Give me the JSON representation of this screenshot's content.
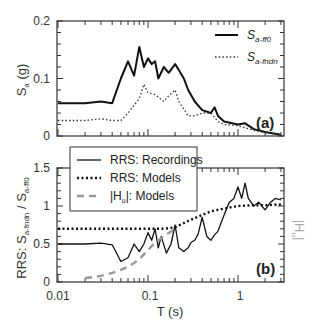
{
  "chart_data": [
    {
      "panel": "(a)",
      "type": "line",
      "title": "",
      "xlabel": "",
      "ylabel": "Sa (g)",
      "xscale": "log",
      "xlim": [
        0.01,
        3
      ],
      "ylim": [
        0,
        0.2
      ],
      "yticks": [
        "0",
        "0.1",
        "0.2"
      ],
      "grid": false,
      "legend_position": "upper right",
      "series": [
        {
          "name": "Sa-ff0",
          "style": "solid",
          "color": "#111111",
          "x": [
            0.01,
            0.02,
            0.03,
            0.04,
            0.05,
            0.06,
            0.07,
            0.08,
            0.09,
            0.1,
            0.11,
            0.12,
            0.13,
            0.15,
            0.17,
            0.2,
            0.22,
            0.25,
            0.28,
            0.33,
            0.4,
            0.5,
            0.55,
            0.6,
            0.7,
            1.0,
            1.2,
            1.5,
            2.0,
            3.0
          ],
          "y": [
            0.057,
            0.057,
            0.06,
            0.057,
            0.1,
            0.13,
            0.105,
            0.155,
            0.12,
            0.135,
            0.125,
            0.13,
            0.1,
            0.12,
            0.11,
            0.125,
            0.115,
            0.1,
            0.08,
            0.06,
            0.045,
            0.04,
            0.05,
            0.035,
            0.025,
            0.02,
            0.022,
            0.012,
            0.007,
            0.002
          ]
        },
        {
          "name": "Sa-fndn",
          "style": "dotted",
          "color": "#333333",
          "x": [
            0.01,
            0.02,
            0.03,
            0.04,
            0.05,
            0.06,
            0.08,
            0.09,
            0.1,
            0.12,
            0.15,
            0.17,
            0.2,
            0.22,
            0.28,
            0.33,
            0.4,
            0.5,
            0.6,
            0.7,
            1.0,
            1.5,
            2.0,
            3.0
          ],
          "y": [
            0.027,
            0.027,
            0.03,
            0.027,
            0.027,
            0.04,
            0.065,
            0.09,
            0.075,
            0.072,
            0.06,
            0.07,
            0.08,
            0.06,
            0.035,
            0.035,
            0.04,
            0.04,
            0.025,
            0.02,
            0.018,
            0.01,
            0.006,
            0.002
          ]
        }
      ]
    },
    {
      "panel": "(b)",
      "type": "line",
      "title": "",
      "xlabel": "T (s)",
      "ylabel": "RRS: Sa-fndn / Sa-ff0",
      "ylabel_right": "|Hu|",
      "xscale": "log",
      "xlim": [
        0.01,
        3
      ],
      "ylim": [
        0,
        1.5
      ],
      "xticks": [
        "0.01",
        "0.1",
        "1"
      ],
      "yticks": [
        "0",
        "0.5",
        "1",
        "1.5"
      ],
      "grid": false,
      "legend_position": "upper left",
      "series": [
        {
          "name": "RRS: Recordings",
          "style": "solid",
          "color": "#111111",
          "x": [
            0.01,
            0.02,
            0.03,
            0.04,
            0.05,
            0.06,
            0.07,
            0.08,
            0.09,
            0.1,
            0.11,
            0.12,
            0.13,
            0.14,
            0.16,
            0.18,
            0.2,
            0.22,
            0.25,
            0.28,
            0.3,
            0.33,
            0.36,
            0.4,
            0.45,
            0.5,
            0.55,
            0.6,
            0.7,
            0.8,
            0.9,
            1.0,
            1.1,
            1.2,
            1.3,
            1.5,
            1.7,
            2.0,
            2.3,
            2.6,
            3.0
          ],
          "y": [
            0.5,
            0.5,
            0.51,
            0.49,
            0.27,
            0.32,
            0.5,
            0.4,
            0.5,
            0.65,
            0.55,
            0.7,
            0.45,
            0.6,
            0.38,
            0.5,
            0.75,
            0.45,
            0.4,
            0.45,
            0.52,
            0.55,
            0.63,
            0.85,
            0.6,
            0.55,
            0.62,
            0.67,
            0.88,
            1.05,
            1.1,
            1.25,
            1.1,
            1.3,
            1.1,
            1.0,
            1.05,
            0.95,
            1.05,
            1.1,
            1.08
          ]
        },
        {
          "name": "RRS: Models",
          "style": "dotted",
          "color": "#111111",
          "x": [
            0.01,
            0.03,
            0.1,
            0.15,
            0.2,
            0.3,
            0.5,
            0.8,
            1.0,
            1.5,
            2.0,
            3.0
          ],
          "y": [
            0.7,
            0.7,
            0.7,
            0.7,
            0.72,
            0.82,
            0.93,
            0.98,
            1.0,
            1.01,
            1.01,
            1.02
          ]
        },
        {
          "name": "|Hu|: Models",
          "style": "dashed",
          "color": "#999999",
          "x": [
            0.02,
            0.03,
            0.04,
            0.05,
            0.06,
            0.07,
            0.08,
            0.1,
            0.12,
            0.15,
            0.2
          ],
          "y": [
            0.05,
            0.08,
            0.12,
            0.16,
            0.2,
            0.25,
            0.3,
            0.42,
            0.52,
            0.6,
            0.7
          ]
        }
      ]
    }
  ],
  "panel_a": {
    "ylabel_main": "S",
    "ylabel_sub": "a",
    "ylabel_unit": " (g)",
    "yticks": [
      "0.2",
      "0.1",
      "0"
    ],
    "legend": [
      {
        "main": "S",
        "sub": "a-ff0"
      },
      {
        "main": "S",
        "sub": "a-fndn"
      }
    ],
    "tag": "(a)"
  },
  "panel_b": {
    "ylabel_prefix": "RRS: S",
    "ylabel_sub1": "a-fndn",
    "ylabel_mid": " / S",
    "ylabel_sub2": "a-ff0",
    "ylabel_right_main": "|H",
    "ylabel_right_sub": "u",
    "ylabel_right_end": "|",
    "yticks": [
      "1.5",
      "1",
      "0.5",
      "0"
    ],
    "xticks": [
      "0.01",
      "0.1",
      "1"
    ],
    "xlabel": "T (s)",
    "legend": [
      {
        "label": "RRS: Recordings"
      },
      {
        "label": "RRS: Models"
      },
      {
        "label_main": "|H",
        "label_sub": "u",
        "label_end": "|: Models"
      }
    ],
    "tag": "(b)"
  }
}
